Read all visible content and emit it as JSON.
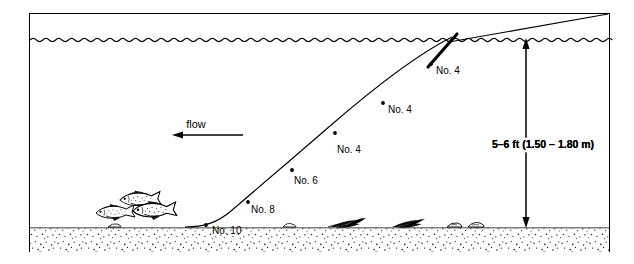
{
  "diagram": {
    "frame": {
      "color": "#000000"
    },
    "water": {
      "surface_label": "water-surface",
      "flow": {
        "label": "flow",
        "direction": "left"
      }
    },
    "depth_annotation": {
      "text": "5–6 ft (1.50 – 1.80 m)",
      "arrow_style": "double-headed-vertical"
    },
    "shot_labels": [
      {
        "id": "shot-1",
        "text": "No. 4"
      },
      {
        "id": "shot-2",
        "text": "No. 4"
      },
      {
        "id": "shot-3",
        "text": "No. 4"
      },
      {
        "id": "shot-4",
        "text": "No. 6"
      },
      {
        "id": "shot-5",
        "text": "No. 8"
      },
      {
        "id": "shot-6",
        "text": "No. 10"
      }
    ],
    "bed": {
      "name": "riverbed-sand",
      "fill": "#ffffff",
      "stipple_color": "#1a1a1a"
    },
    "fish": {
      "count": 3,
      "facing": "left"
    },
    "weeds": {
      "count": 4
    },
    "colors": {
      "ink": "#000000",
      "line": "#111111"
    }
  }
}
